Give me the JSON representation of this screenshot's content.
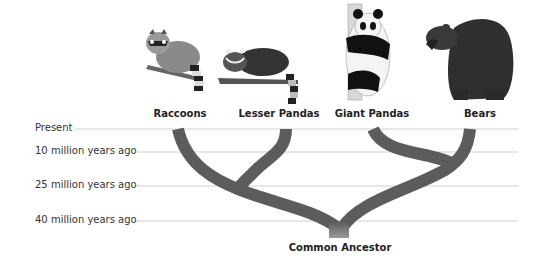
{
  "diagram": {
    "type": "phylogenetic-tree",
    "species": [
      {
        "label": "Raccoons",
        "icon": "raccoon-illustration"
      },
      {
        "label": "Lesser Pandas",
        "icon": "red-panda-illustration"
      },
      {
        "label": "Giant Pandas",
        "icon": "giant-panda-illustration"
      },
      {
        "label": "Bears",
        "icon": "bear-illustration"
      }
    ],
    "timeline": [
      {
        "label": "Present"
      },
      {
        "label": "10 million years ago"
      },
      {
        "label": "25 million years ago"
      },
      {
        "label": "40 million years ago"
      }
    ],
    "root_label": "Common Ancestor",
    "branch_color": "#5c5c5c",
    "gridline_color": "#cfcfcf",
    "divergences": [
      {
        "between": [
          "Giant Pandas",
          "Bears"
        ],
        "approx": "between 10 and 25 million years ago"
      },
      {
        "between": [
          "Raccoons",
          "Lesser Pandas"
        ],
        "approx": "about 25 million years ago"
      },
      {
        "between": [
          "Raccoon/Lesser Panda clade",
          "Giant Panda/Bear clade"
        ],
        "approx": "about 40 million years ago"
      }
    ]
  }
}
